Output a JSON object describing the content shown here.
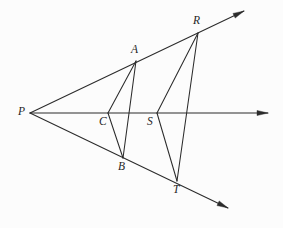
{
  "figure": {
    "background_color": "#fcfcfc",
    "line_color": "#2b2b2b",
    "width": 283,
    "height": 228
  },
  "labels": {
    "P": "P",
    "A": "A",
    "B": "B",
    "C": "C",
    "R": "R",
    "S": "S",
    "T": "T"
  },
  "chart_data": {
    "type": "scatter",
    "xlabel": "",
    "ylabel": "",
    "xlim": [
      0,
      283
    ],
    "ylim": [
      228,
      0
    ],
    "grid": false,
    "legend": "none",
    "points": [
      {
        "name": "P",
        "x": 30,
        "y": 113,
        "label": "P",
        "label_x": 18,
        "label_y": 106
      },
      {
        "name": "A",
        "x": 136,
        "y": 61,
        "label": "A",
        "label_x": 131,
        "label_y": 44
      },
      {
        "name": "R",
        "x": 198,
        "y": 33,
        "label": "R",
        "label_x": 193,
        "label_y": 15
      },
      {
        "name": "C",
        "x": 108,
        "y": 113,
        "label": "C",
        "label_x": 99,
        "label_y": 116
      },
      {
        "name": "S",
        "x": 157,
        "y": 113,
        "label": "S",
        "label_x": 147,
        "label_y": 116
      },
      {
        "name": "B",
        "x": 123,
        "y": 158,
        "label": "B",
        "label_x": 118,
        "label_y": 161
      },
      {
        "name": "T",
        "x": 177,
        "y": 181,
        "label": "T",
        "label_x": 173,
        "label_y": 184
      }
    ],
    "rays": [
      {
        "name": "upper-ray",
        "from": "P",
        "x1": 30,
        "y1": 113,
        "x2": 244,
        "y2": 11,
        "arrow": true
      },
      {
        "name": "horizontal-ray",
        "from": "P",
        "x1": 30,
        "y1": 113,
        "x2": 268,
        "y2": 113,
        "arrow": true
      },
      {
        "name": "lower-ray",
        "from": "P",
        "x1": 30,
        "y1": 113,
        "x2": 228,
        "y2": 208,
        "arrow": true
      }
    ],
    "segments": [
      {
        "name": "segment-AC",
        "from": "A",
        "to": "C",
        "x1": 136,
        "y1": 61,
        "x2": 108,
        "y2": 113
      },
      {
        "name": "segment-CB",
        "from": "C",
        "to": "B",
        "x1": 108,
        "y1": 113,
        "x2": 123,
        "y2": 158
      },
      {
        "name": "segment-AB",
        "from": "A",
        "to": "B",
        "x1": 136,
        "y1": 61,
        "x2": 123,
        "y2": 158
      },
      {
        "name": "segment-RS",
        "from": "R",
        "to": "S",
        "x1": 198,
        "y1": 33,
        "x2": 157,
        "y2": 113
      },
      {
        "name": "segment-ST",
        "from": "S",
        "to": "T",
        "x1": 157,
        "y1": 113,
        "x2": 177,
        "y2": 181
      },
      {
        "name": "segment-RT",
        "from": "R",
        "to": "T",
        "x1": 198,
        "y1": 33,
        "x2": 177,
        "y2": 181
      }
    ]
  }
}
